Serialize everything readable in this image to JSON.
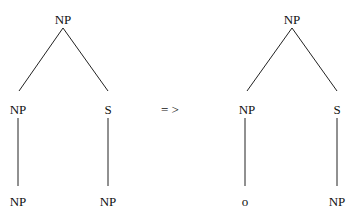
{
  "diagram": {
    "type": "syntax-tree-transformation",
    "arrow": "= >",
    "left_tree": {
      "root": "NP",
      "children": [
        {
          "label": "NP",
          "child": "NP"
        },
        {
          "label": "S",
          "child": "NP"
        }
      ]
    },
    "right_tree": {
      "root": "NP",
      "children": [
        {
          "label": "NP",
          "child": "o"
        },
        {
          "label": "S",
          "child": "NP"
        }
      ]
    },
    "colors": {
      "text": "#111111",
      "lines": "#222222",
      "background": "#ffffff"
    }
  }
}
